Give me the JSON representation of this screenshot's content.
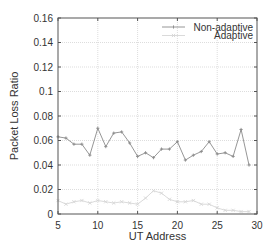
{
  "chart_data": {
    "type": "line",
    "title": "",
    "xlabel": "UT Address",
    "ylabel": "Packet Loss Ratio",
    "xlim": [
      5,
      30
    ],
    "ylim": [
      0,
      0.16
    ],
    "xticks": [
      5,
      10,
      15,
      20,
      25,
      30
    ],
    "yticks": [
      0,
      0.02,
      0.04,
      0.06,
      0.08,
      0.1,
      0.12,
      0.14,
      0.16
    ],
    "ytick_labels": [
      "0",
      "0.02",
      "0.04",
      "0.06",
      "0.08",
      "0.1",
      "0.12",
      "0.14",
      "0.16"
    ],
    "grid": true,
    "legend_position": "upper right",
    "x": [
      5,
      6,
      7,
      8,
      9,
      10,
      11,
      12,
      13,
      14,
      15,
      16,
      17,
      18,
      19,
      20,
      21,
      22,
      23,
      24,
      25,
      26,
      27,
      28,
      29
    ],
    "series": [
      {
        "name": "Non-adaptive",
        "color": "#8a8a8a",
        "marker": "plus",
        "values": [
          0.063,
          0.062,
          0.057,
          0.057,
          0.048,
          0.07,
          0.055,
          0.066,
          0.067,
          0.058,
          0.047,
          0.05,
          0.046,
          0.053,
          0.053,
          0.059,
          0.044,
          0.048,
          0.051,
          0.059,
          0.049,
          0.05,
          0.047,
          0.069,
          0.04
        ]
      },
      {
        "name": "Adaptive",
        "color": "#d6d6d6",
        "marker": "x",
        "values": [
          0.011,
          0.008,
          0.01,
          0.011,
          0.009,
          0.011,
          0.01,
          0.009,
          0.01,
          0.009,
          0.008,
          0.013,
          0.019,
          0.017,
          0.012,
          0.01,
          0.01,
          0.011,
          0.008,
          0.008,
          0.005,
          0.003,
          0.003,
          0.002,
          0.002
        ]
      }
    ]
  }
}
